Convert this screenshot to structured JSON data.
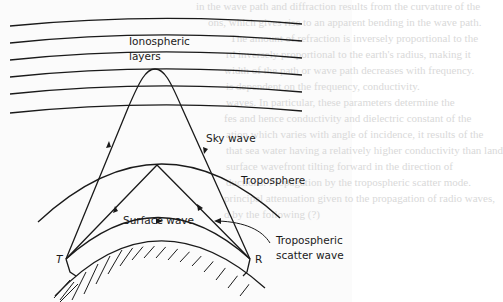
{
  "figure": {
    "labels": {
      "ionospheric_line1": "Ionospheric",
      "ionospheric_line2": "layers",
      "sky_wave": "Sky wave",
      "troposphere": "Troposphere",
      "surface_wave": "Surface wave",
      "tropo_scatter_line1": "Tropospheric",
      "tropo_scatter_line2": "scatter wave",
      "transmitter": "T",
      "receiver": "R"
    },
    "ionospheric_layer_count": 6,
    "colors": {
      "ink": "#1a1a1a",
      "background": "#fbfbfb",
      "bleed_text": "#d9d9d9"
    }
  },
  "bleed_through": [
    "in the wave path and diffraction results from the curvature of the",
    "ons, which gives rise to an apparent bending in the wave path.",
    "The amount of refraction is inversely proportional to the",
    "rd inversely proportional to the earth's radius, making it",
    "width of the path or wave path decreases with frequency.",
    "is dependent on the frequency, conductivity.",
    "waves. In particular, these parameters determine the",
    "fes and hence conductivity and dielectric constant of the",
    "ation which varies with angle of incidence, it results of the",
    "that sea water having a relatively higher conductivity than land",
    "surface wavefront tilting forward in the direction of",
    "ductions. Propagation by the tropospheric scatter mode.",
    "principal attenuation given to the propagation of radio waves,",
    "d by the following (?)"
  ]
}
